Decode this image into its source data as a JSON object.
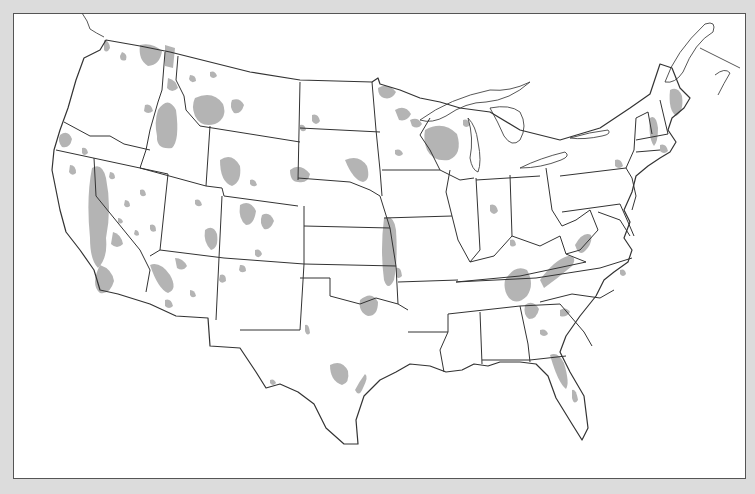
{
  "map": {
    "type": "outline map",
    "region": "contiguous United States with state boundaries",
    "labels": [],
    "legend": null,
    "colors": {
      "background": "#dcdcdc",
      "map_fill": "#ffffff",
      "border_stroke": "#333333",
      "shaded_regions": "#b4b4b4"
    },
    "shaded_region_areas": [
      "Pacific Northwest (N Washington, N Idaho, W Montana)",
      "California Central Valley & Sierra foothills",
      "Southern California",
      "Nevada / Great Basin (scattered)",
      "Arizona & New Mexico (scattered)",
      "Wyoming & Colorado Rockies",
      "Western South Dakota / Nebraska sandhills edge",
      "Northern Minnesota",
      "Wisconsin central",
      "Eastern Kansas / western Missouri (Flint Hills)",
      "Central Oklahoma",
      "Central & east Texas",
      "Appalachians (Tennessee, Virginia, Georgia, Alabama)",
      "Florida peninsula",
      "New England (Maine, New Hampshire, Vermont)"
    ]
  }
}
